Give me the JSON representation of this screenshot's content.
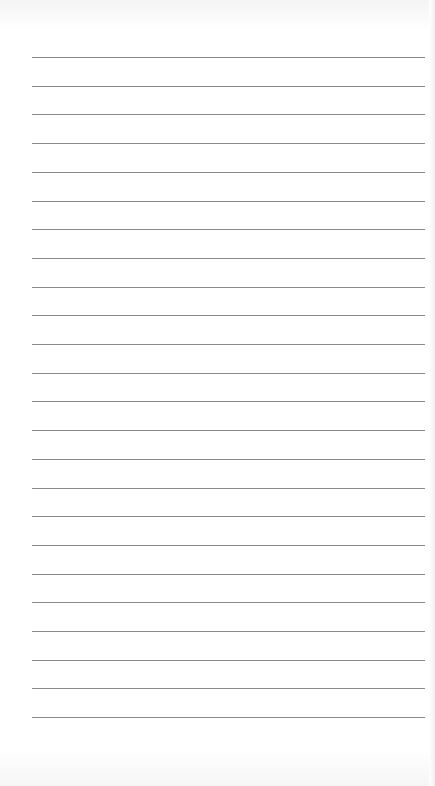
{
  "document": {
    "type": "lined-paper",
    "line_count": 24,
    "first_line_y": 57,
    "line_spacing": 28.7,
    "line_left": 32,
    "line_right": 425,
    "line_color": "#8a8a8a",
    "background_color": "#ffffff"
  }
}
